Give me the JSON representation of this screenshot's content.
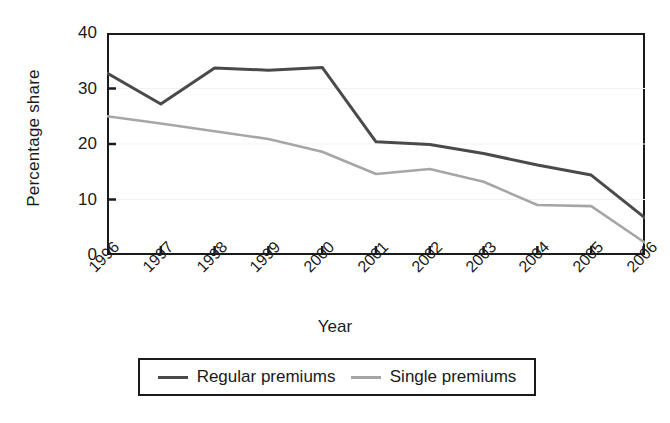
{
  "chart_data": {
    "type": "line",
    "title": "",
    "xlabel": "Year",
    "ylabel": "Percentage share",
    "categories": [
      "1996",
      "1997",
      "1998",
      "1999",
      "2000",
      "2001",
      "2002",
      "2003",
      "2004",
      "2005",
      "2006"
    ],
    "x": [
      1996,
      1997,
      1998,
      1999,
      2000,
      2001,
      2002,
      2003,
      2004,
      2005,
      2006
    ],
    "xlim": [
      1996,
      2006
    ],
    "ylim": [
      0,
      40
    ],
    "yticks": [
      0,
      10,
      20,
      30,
      40
    ],
    "ytick_labels": [
      "0",
      "10",
      "20",
      "30",
      "40"
    ],
    "grid": false,
    "legend_position": "bottom",
    "series": [
      {
        "name": "Regular premiums",
        "color": "#4a4a4a",
        "values": [
          32.8,
          27.2,
          33.7,
          33.3,
          33.8,
          20.4,
          19.9,
          18.3,
          16.2,
          14.4,
          6.7
        ]
      },
      {
        "name": "Single premiums",
        "color": "#a6a6a6",
        "values": [
          25.0,
          23.7,
          22.3,
          20.9,
          18.6,
          14.6,
          15.5,
          13.2,
          9.0,
          8.8,
          2.2
        ]
      }
    ]
  },
  "legend": {
    "entries": [
      {
        "label": "Regular premiums",
        "swatch": "line-swatch-regular"
      },
      {
        "label": "Single premiums",
        "swatch": "line-swatch-single"
      }
    ]
  },
  "axes": {
    "y_title": "Percentage share",
    "x_title": "Year"
  }
}
